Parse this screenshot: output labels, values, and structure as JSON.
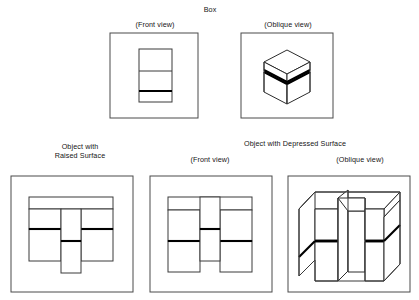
{
  "figure": {
    "title": "Box",
    "panels": [
      {
        "id": "box-front",
        "caption": "(Front view)"
      },
      {
        "id": "box-oblique",
        "caption": "(Oblique view)"
      },
      {
        "id": "raised-front",
        "caption": "Object with\nRaised Surface"
      },
      {
        "id": "depressed-front",
        "caption": "(Front view)"
      },
      {
        "id": "depressed-oblique",
        "caption": "(Oblique view)"
      }
    ],
    "group_titles": {
      "box": "Box",
      "depressed": "Object with Depressed Surface"
    },
    "colors": {
      "frame_stroke": "#4a4a4a",
      "thin_stroke": "#3a3a3a",
      "bold_stroke": "#000000",
      "face_fill": "#ffffff",
      "background": "#ffffff",
      "text": "#141414"
    }
  }
}
